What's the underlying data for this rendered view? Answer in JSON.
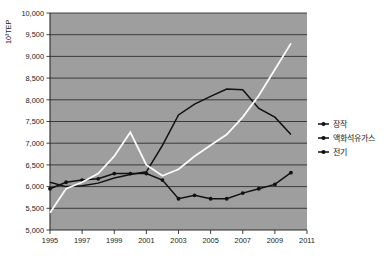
{
  "chart_data": {
    "type": "line",
    "title": "",
    "xlabel": "",
    "ylabel": "10³TEP",
    "x": [
      1995,
      1996,
      1997,
      1998,
      1999,
      2000,
      2001,
      2002,
      2003,
      2004,
      2005,
      2006,
      2007,
      2008,
      2009,
      2010
    ],
    "xlim": [
      1995,
      2011
    ],
    "ylim": [
      5000,
      10000
    ],
    "xticks": [
      "1995",
      "1997",
      "1999",
      "2001",
      "2003",
      "2005",
      "2007",
      "2009",
      "2011"
    ],
    "yticks": [
      "5,000",
      "5,500",
      "6,000",
      "6,500",
      "7,000",
      "7,500",
      "8,000",
      "8,500",
      "9,000",
      "9,500",
      "10,000"
    ],
    "grid": true,
    "legend_position": "right",
    "series": [
      {
        "name": "장작",
        "color": "#111111",
        "marker": "circle",
        "values": [
          5950,
          6100,
          6150,
          6180,
          6300,
          6300,
          6300,
          6150,
          5720,
          5800,
          5720,
          5720,
          5850,
          5950,
          6050,
          6320
        ]
      },
      {
        "name": "액화석유가스",
        "color": "#111111",
        "marker": "none",
        "values": [
          6100,
          6000,
          6020,
          6080,
          6200,
          6280,
          6340,
          6950,
          7650,
          7900,
          8080,
          8250,
          8230,
          7800,
          7600,
          7200
        ]
      },
      {
        "name": "전기",
        "color": "#fbfbfb",
        "marker": "none",
        "values": [
          5400,
          5950,
          6100,
          6300,
          6700,
          7250,
          6500,
          6250,
          6400,
          6700,
          6950,
          7200,
          7600,
          8100,
          8700,
          9300
        ]
      }
    ]
  },
  "legend": {
    "items": [
      {
        "label": "장작",
        "color": "#111111"
      },
      {
        "label": "액화석유가스",
        "color": "#111111"
      },
      {
        "label": "전기",
        "color": "#111111"
      }
    ]
  },
  "axes": {
    "y_title": "10³TEP",
    "y_labels": [
      "10,000",
      "9,500",
      "9,000",
      "8,500",
      "8,000",
      "7,500",
      "7,000",
      "6,500",
      "6,000",
      "5,500",
      "5,000"
    ],
    "x_labels": [
      "1995",
      "1997",
      "1999",
      "2001",
      "2003",
      "2005",
      "2007",
      "2009",
      "2011"
    ]
  }
}
